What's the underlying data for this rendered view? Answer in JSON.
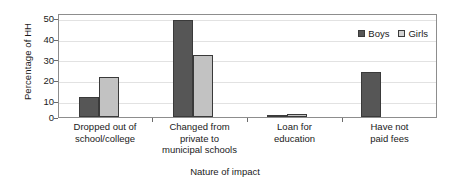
{
  "chart_data": {
    "type": "bar",
    "title": "",
    "xlabel": "Nature of impact",
    "ylabel": "Percentage of HH",
    "ylim": [
      0,
      50
    ],
    "yticks": [
      0,
      10,
      20,
      30,
      40,
      50
    ],
    "grid": true,
    "legend_position": "top-right",
    "categories": [
      "Dropped out of\nschool/college",
      "Changed from\nprivate to\nmunicipal schools",
      "Loan for\neducation",
      "Have not\npaid fees"
    ],
    "category_lines": [
      [
        "Dropped out of",
        "school/college"
      ],
      [
        "Changed from",
        "private to",
        "municipal schools"
      ],
      [
        "Loan for",
        "education"
      ],
      [
        "Have not",
        "paid fees"
      ]
    ],
    "series": [
      {
        "name": "Boys",
        "color": "#565656",
        "values": [
          9.8,
          47.4,
          1.0,
          22.3
        ]
      },
      {
        "name": "Girls",
        "color": "#c2c2c2",
        "values": [
          19.4,
          30.5,
          1.4,
          0
        ]
      }
    ]
  },
  "axis": {
    "y_title": "Percentage of HH",
    "x_title": "Nature of impact",
    "y_tick_labels": [
      "50",
      "40",
      "30",
      "20",
      "10",
      "0"
    ]
  },
  "legend": {
    "items": [
      {
        "label": "Boys",
        "swatch": "dark-gray-swatch-icon"
      },
      {
        "label": "Girls",
        "swatch": "light-gray-swatch-icon"
      }
    ]
  }
}
